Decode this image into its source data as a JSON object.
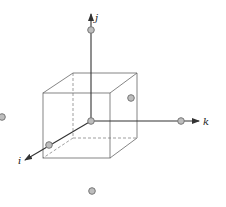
{
  "diagram": {
    "type": "lattice-cube-axes",
    "axes": {
      "i": {
        "label": "i"
      },
      "j": {
        "label": "j"
      },
      "k": {
        "label": "k"
      }
    },
    "colors": {
      "line": "#333333",
      "cube_edge": "#666666",
      "atom_fill": "#bdbdbd",
      "atom_stroke": "#777777"
    },
    "atoms": [
      {
        "name": "origin",
        "x": 91,
        "y": 121
      },
      {
        "name": "j-axis-atom",
        "x": 91,
        "y": 30
      },
      {
        "name": "k-axis-atom",
        "x": 181,
        "y": 121
      },
      {
        "name": "i-axis-atom",
        "x": 49,
        "y": 145
      },
      {
        "name": "face-atom",
        "x": 131,
        "y": 98
      },
      {
        "name": "left-atom",
        "x": 2,
        "y": 117
      },
      {
        "name": "bottom-atom",
        "x": 92,
        "y": 191
      }
    ]
  }
}
